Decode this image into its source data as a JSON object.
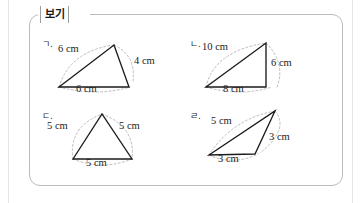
{
  "page": {
    "box_label": "보기",
    "accent_color": "#b9bcc0",
    "line_color": "#1b1b1b",
    "arc_color": "#b4b4b4"
  },
  "figures": [
    {
      "marker": "ㄱ.",
      "shape": "triangle",
      "labels": {
        "left": "6 cm",
        "right": "4 cm",
        "bottom": "6 cm"
      },
      "sides_cm": [
        6,
        4,
        6
      ]
    },
    {
      "marker": "ㄴ.",
      "shape": "right-triangle",
      "labels": {
        "left": "10 cm",
        "right": "6 cm",
        "bottom": "8 cm"
      },
      "sides_cm": [
        10,
        6,
        8
      ]
    },
    {
      "marker": "ㄷ.",
      "shape": "equilateral-triangle",
      "labels": {
        "left": "5 cm",
        "right": "5 cm",
        "bottom": "5 cm"
      },
      "sides_cm": [
        5,
        5,
        5
      ]
    },
    {
      "marker": "ㄹ.",
      "shape": "obtuse-triangle",
      "labels": {
        "left": "5 cm",
        "right": "3 cm",
        "bottom": "3 cm"
      },
      "sides_cm": [
        5,
        3,
        3
      ]
    }
  ]
}
